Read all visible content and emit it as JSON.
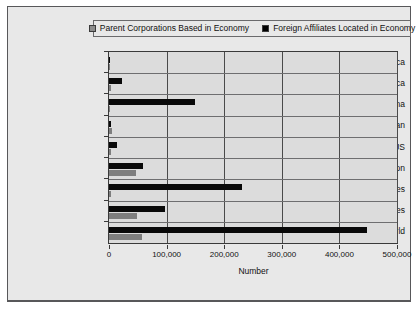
{
  "chart_data": {
    "type": "bar",
    "orientation": "horizontal",
    "title": "",
    "xlabel": "Number",
    "ylabel": "",
    "xlim": [
      0,
      500000
    ],
    "xticks": [
      0,
      100000,
      200000,
      300000,
      400000,
      500000
    ],
    "xtick_labels": [
      "0",
      "100,000",
      "200,000",
      "300,000",
      "400,000",
      "500,000"
    ],
    "grid": true,
    "legend_position": "top",
    "categories": [
      "Africa",
      "Latin America",
      "China",
      "Japan",
      "US",
      "European Union",
      "Developing Economies",
      "Developed Economies",
      "World"
    ],
    "series": [
      {
        "name": "Parent Corporations Based in Economy",
        "color": "#7e7e7e",
        "values": [
          700,
          3900,
          2000,
          4500,
          3400,
          47000,
          4100,
          48000,
          57000
        ]
      },
      {
        "name": "Foreign Affiliates Located in Economy",
        "color": "#090909",
        "values": [
          1000,
          22000,
          150000,
          4000,
          14000,
          59000,
          231000,
          98000,
          448000
        ]
      }
    ]
  },
  "legend": {
    "items": [
      {
        "label": "Parent Corporations Based in Economy",
        "swatch": "gray"
      },
      {
        "label": "Foreign Affiliates Located in Economy",
        "swatch": "black"
      }
    ]
  },
  "axis": {
    "x_title": "Number"
  },
  "colors": {
    "panel_background": "#e8e8e8",
    "plot_background": "#dcdcdc",
    "frame": "#3a3a3a",
    "series_gray": "#7e7e7e",
    "series_black": "#090909"
  }
}
